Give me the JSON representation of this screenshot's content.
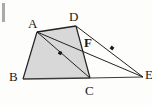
{
  "figure": {
    "canvas": {
      "width": 152,
      "height": 105
    },
    "background_color": "#fdfdfc",
    "fill_color": "#d8d8d8",
    "stroke_color": "#222222",
    "label_color": "#1a1a1a",
    "points": [
      {
        "name": "A",
        "x": 37,
        "y": 32,
        "label": "A",
        "label_x": 28,
        "label_y": 17
      },
      {
        "name": "D",
        "x": 76,
        "y": 26,
        "label": "D",
        "label_x": 69,
        "label_y": 10
      },
      {
        "name": "B",
        "x": 23,
        "y": 79,
        "label": "B",
        "label_x": 9,
        "label_y": 70
      },
      {
        "name": "C",
        "x": 90,
        "y": 78,
        "label": "C",
        "label_x": 85,
        "label_y": 84
      },
      {
        "name": "E",
        "x": 143,
        "y": 77,
        "label": "E",
        "label_x": 145,
        "label_y": 68
      },
      {
        "name": "F",
        "x": 82,
        "y": 46,
        "label": "F",
        "label_x": 84,
        "label_y": 36
      }
    ],
    "polygon": {
      "name": "ABCD",
      "vertices": "A,D,C,B",
      "filled": true
    },
    "segments": [
      {
        "name": "AD",
        "from": "A",
        "to": "D"
      },
      {
        "name": "DC",
        "from": "D",
        "to": "C"
      },
      {
        "name": "CB",
        "from": "C",
        "to": "B"
      },
      {
        "name": "BA",
        "from": "B",
        "to": "A"
      },
      {
        "name": "AC",
        "from": "A",
        "to": "C"
      },
      {
        "name": "AE",
        "from": "A",
        "to": "E"
      },
      {
        "name": "DE",
        "from": "D",
        "to": "E"
      },
      {
        "name": "CE",
        "from": "C",
        "to": "E"
      }
    ],
    "tick_marks": [
      {
        "name": "tick-on-AE",
        "on": "AE",
        "x": 60,
        "y": 53
      },
      {
        "name": "tick-on-DE",
        "on": "DE",
        "x": 112,
        "y": 48
      }
    ],
    "margin_bar": {
      "name": "page-margin-bar",
      "color": "#a9a9a9"
    }
  }
}
